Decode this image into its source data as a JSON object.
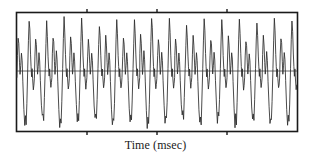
{
  "figure": {
    "background_color": "#ffffff",
    "frame_color": "#1a1a1a",
    "trace_color": "#2b2b2b",
    "baseline_color": "#555555"
  },
  "axis": {
    "xlabel": "Time (msec)",
    "tick_count": 3,
    "tick_side": "both"
  },
  "chart_data": {
    "type": "line",
    "title": "",
    "xlabel": "Time (msec)",
    "ylabel": "",
    "grid": false,
    "legend": null,
    "xlim": [
      0,
      320
    ],
    "ylim": [
      -1.15,
      1.15
    ],
    "baseline": 0,
    "xticks": [
      80,
      160,
      240
    ],
    "xticklabels": [
      "",
      "",
      ""
    ],
    "yticks": [],
    "cycle_count": 16,
    "cycle_period": 20,
    "series": [
      {
        "name": "waveform",
        "color": "#2b2b2b",
        "cycle_template": [
          {
            "t": 0.0,
            "v": -0.12
          },
          {
            "t": 0.03,
            "v": 0.3
          },
          {
            "t": 0.07,
            "v": 0.62
          },
          {
            "t": 0.11,
            "v": 0.5
          },
          {
            "t": 0.15,
            "v": 0.16
          },
          {
            "t": 0.18,
            "v": -0.06
          },
          {
            "t": 0.22,
            "v": 0.1
          },
          {
            "t": 0.26,
            "v": 0.34
          },
          {
            "t": 0.3,
            "v": 0.2
          },
          {
            "t": 0.34,
            "v": -0.18
          },
          {
            "t": 0.4,
            "v": -0.66
          },
          {
            "t": 0.45,
            "v": -0.92
          },
          {
            "t": 0.49,
            "v": -0.8
          },
          {
            "t": 0.53,
            "v": -0.9
          },
          {
            "t": 0.57,
            "v": -0.55
          },
          {
            "t": 0.62,
            "v": 0.05
          },
          {
            "t": 0.66,
            "v": 0.55
          },
          {
            "t": 0.7,
            "v": 0.95
          },
          {
            "t": 0.74,
            "v": 0.72
          },
          {
            "t": 0.78,
            "v": 0.3
          },
          {
            "t": 0.81,
            "v": 0.08
          },
          {
            "t": 0.84,
            "v": -0.1
          },
          {
            "t": 0.87,
            "v": 0.04
          },
          {
            "t": 0.9,
            "v": -0.14
          },
          {
            "t": 0.94,
            "v": -0.32
          },
          {
            "t": 0.97,
            "v": -0.24
          },
          {
            "t": 1.0,
            "v": -0.12
          }
        ],
        "amplitude_envelope": [
          1.0,
          0.92,
          1.02,
          0.96,
          0.9,
          1.0,
          0.94,
          1.04,
          0.97,
          0.91,
          1.0,
          0.95,
          1.02,
          0.93,
          0.99,
          1.0
        ]
      }
    ]
  }
}
